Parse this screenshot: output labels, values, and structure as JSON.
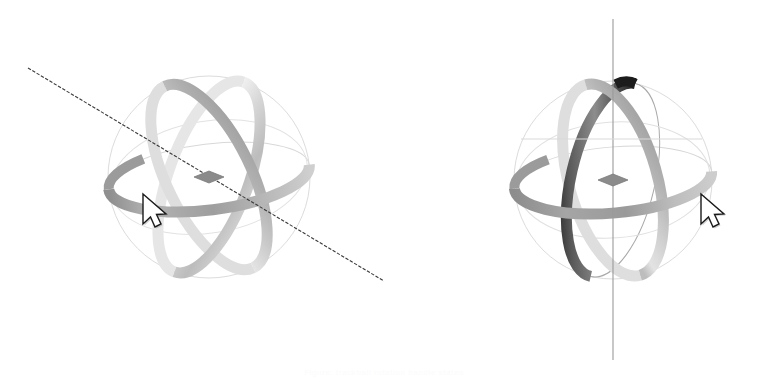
{
  "scene": {
    "title": "3D Rotation Gizmo Comparison",
    "background_color": "#ffffff",
    "width": 768,
    "height": 384,
    "caption": "Figure: trackball rotation handle states"
  },
  "palette": {
    "band_light": "#d9d9d9",
    "band_mid": "#a8a8a8",
    "band_dark": "#6e6e6e",
    "band_black": "#1c1c1c",
    "outline_faint": "#d2d2d2",
    "outline_mid": "#b5b5b5",
    "axis_line": "#7a7a7a",
    "axis_line_dark": "#3a3a3a",
    "center_handle": "#8b8b8b",
    "cursor_fill": "#ffffff",
    "cursor_stroke": "#1a1a1a",
    "cursor_shadow": "#9a9a9a"
  },
  "panels": [
    {
      "id": "left",
      "name": "gizmo-free-axis",
      "label": "Free axis rotation gizmo",
      "center": {
        "x": 209,
        "y": 177
      },
      "radius": 102,
      "axis": {
        "name": "rotation-axis-line",
        "kind": "diagonal",
        "style": "dashed-thin",
        "color": "#3a3a3a",
        "x1": 28,
        "y1": 68,
        "x2": 409,
        "y2": 296
      },
      "center_handle": {
        "name": "center-pivot-diamond",
        "shape": "diamond",
        "width": 30,
        "height": 12,
        "color": "#8b8b8b"
      },
      "bands": [
        {
          "name": "equator-band",
          "tone": "mid",
          "highlight": "left"
        },
        {
          "name": "meridian-band-a",
          "tone": "light",
          "highlight": "top-right"
        },
        {
          "name": "meridian-band-b",
          "tone": "mid",
          "highlight": "top-left"
        }
      ],
      "outlines": [
        {
          "name": "silhouette-circle",
          "tone": "faint"
        },
        {
          "name": "orbit-ellipse-horizontal",
          "tone": "faint"
        },
        {
          "name": "orbit-ellipse-tilt-a",
          "tone": "faint"
        },
        {
          "name": "orbit-ellipse-tilt-b",
          "tone": "faint"
        }
      ],
      "cursor": {
        "name": "mouse-cursor",
        "x": 142,
        "y": 196,
        "state": "arrow"
      }
    },
    {
      "id": "right",
      "name": "gizmo-vertical-axis",
      "label": "Vertical axis rotation gizmo",
      "center": {
        "x": 613,
        "y": 180
      },
      "radius": 100,
      "axis": {
        "name": "rotation-axis-line",
        "kind": "vertical",
        "style": "solid-thin",
        "color": "#9a9a9a",
        "x1": 613,
        "y1": 19,
        "x2": 613,
        "y2": 360
      },
      "center_handle": {
        "name": "center-pivot-diamond",
        "shape": "diamond",
        "width": 30,
        "height": 12,
        "color": "#8b8b8b"
      },
      "bands": [
        {
          "name": "equator-band",
          "tone": "mid",
          "highlight": "right"
        },
        {
          "name": "meridian-band-a",
          "tone": "dark",
          "highlight": "bottom-left"
        },
        {
          "name": "meridian-band-b",
          "tone": "mid",
          "highlight": "top-right"
        }
      ],
      "outlines": [
        {
          "name": "silhouette-circle",
          "tone": "faint"
        },
        {
          "name": "orbit-ellipse-horizontal",
          "tone": "faint"
        },
        {
          "name": "orbit-ellipse-tilt-a",
          "tone": "mid"
        },
        {
          "name": "orbit-ellipse-tilt-b",
          "tone": "faint"
        }
      ],
      "cursor": {
        "name": "mouse-cursor",
        "x": 700,
        "y": 196,
        "state": "arrow"
      }
    }
  ]
}
